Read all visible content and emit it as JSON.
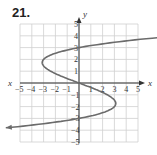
{
  "problem_number": "21.",
  "chart_data": {
    "type": "line",
    "title": "",
    "xlabel": "x",
    "ylabel": "y",
    "xlim": [
      -5,
      5
    ],
    "ylim": [
      -5,
      5
    ],
    "grid": true,
    "x_ticks": [
      "-5",
      "-4",
      "-3",
      "-2",
      "-1",
      "1",
      "2",
      "3",
      "4",
      "5"
    ],
    "y_ticks": [
      "5",
      "4",
      "3",
      "2",
      "1",
      "-1",
      "-2",
      "-3",
      "-4",
      "-5"
    ],
    "series": [
      {
        "name": "curve",
        "description": "sideways cubic-shaped curve with arrows at both ends",
        "points": [
          {
            "x": -4.8,
            "y": -3.8
          },
          {
            "x": 0,
            "y": -3
          },
          {
            "x": 3,
            "y": -2
          },
          {
            "x": 0,
            "y": 0
          },
          {
            "x": -3,
            "y": 2
          },
          {
            "x": 0,
            "y": 3
          },
          {
            "x": 4.9,
            "y": 3.9
          }
        ]
      }
    ],
    "colors": {
      "curve": "#6b6b6b",
      "grid": "#cccccc",
      "axis": "#333333"
    }
  }
}
